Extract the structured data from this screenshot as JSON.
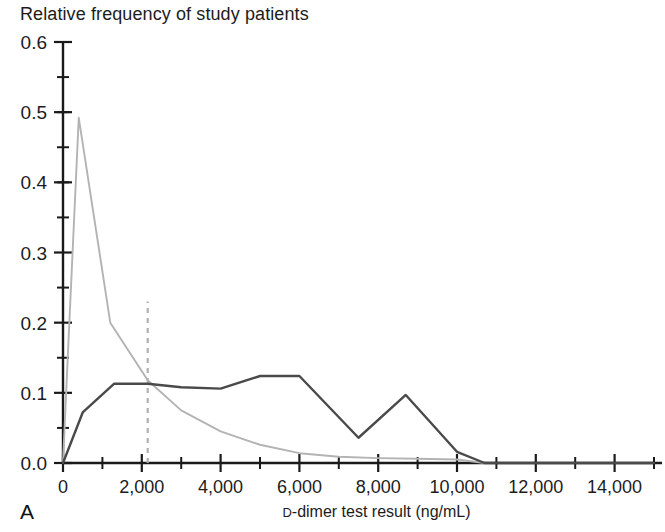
{
  "figure": {
    "panel_label": "A",
    "title": "Relative frequency of study patients",
    "xlabel_prefix": "D",
    "xlabel_rest": "-dimer test result (ng/mL)",
    "xlabel_full": "D-dimer test result (ng/mL)"
  },
  "colors": {
    "axis": "#1a1a1a",
    "series_dark": "#4a4a4a",
    "series_light": "#b3b3b3",
    "threshold_dashed": "#b0b0b0",
    "background": "#ffffff"
  },
  "chart_data": {
    "type": "line",
    "title": "Relative frequency of study patients",
    "xlabel": "D-dimer test result (ng/mL)",
    "ylabel": "Relative frequency of study patients",
    "xlim": [
      0,
      15000
    ],
    "ylim": [
      0.0,
      0.6
    ],
    "grid": false,
    "legend_position": "none",
    "x_ticks": [
      0,
      2000,
      4000,
      6000,
      8000,
      10000,
      12000,
      14000
    ],
    "x_tick_labels": [
      "0",
      "2,000",
      "4,000",
      "6,000",
      "8,000",
      "10,000",
      "12,000",
      "14,000"
    ],
    "x_minor_tick_interval": 1000,
    "y_ticks": [
      0.0,
      0.1,
      0.2,
      0.3,
      0.4,
      0.5,
      0.6
    ],
    "y_tick_labels": [
      "0.0",
      "0.1",
      "0.2",
      "0.3",
      "0.4",
      "0.5",
      "0.6"
    ],
    "y_minor_tick_interval": 0.05,
    "annotations": [
      {
        "name": "threshold-dashed-line",
        "type": "vertical-dashed-line",
        "x": 2150,
        "y_from": 0.0,
        "y_to": 0.23
      }
    ],
    "series": [
      {
        "name": "light-gray-distribution",
        "color": "#b3b3b3",
        "style": "solid",
        "points": [
          {
            "x": 0,
            "y": 0.0
          },
          {
            "x": 120,
            "y": 0.15
          },
          {
            "x": 400,
            "y": 0.492
          },
          {
            "x": 1200,
            "y": 0.2
          },
          {
            "x": 2150,
            "y": 0.118
          },
          {
            "x": 3000,
            "y": 0.075
          },
          {
            "x": 4000,
            "y": 0.045
          },
          {
            "x": 5000,
            "y": 0.026
          },
          {
            "x": 6000,
            "y": 0.014
          },
          {
            "x": 7000,
            "y": 0.009
          },
          {
            "x": 8000,
            "y": 0.007
          },
          {
            "x": 9000,
            "y": 0.006
          },
          {
            "x": 10000,
            "y": 0.005
          },
          {
            "x": 10700,
            "y": 0.0
          },
          {
            "x": 15000,
            "y": 0.0
          }
        ]
      },
      {
        "name": "dark-gray-distribution",
        "color": "#4a4a4a",
        "style": "solid",
        "points": [
          {
            "x": 0,
            "y": 0.0
          },
          {
            "x": 500,
            "y": 0.072
          },
          {
            "x": 1300,
            "y": 0.113
          },
          {
            "x": 2150,
            "y": 0.113
          },
          {
            "x": 3000,
            "y": 0.108
          },
          {
            "x": 4000,
            "y": 0.106
          },
          {
            "x": 5000,
            "y": 0.124
          },
          {
            "x": 6000,
            "y": 0.124
          },
          {
            "x": 7500,
            "y": 0.036
          },
          {
            "x": 8700,
            "y": 0.097
          },
          {
            "x": 10000,
            "y": 0.016
          },
          {
            "x": 10700,
            "y": 0.0
          },
          {
            "x": 15000,
            "y": 0.0
          }
        ]
      }
    ]
  }
}
